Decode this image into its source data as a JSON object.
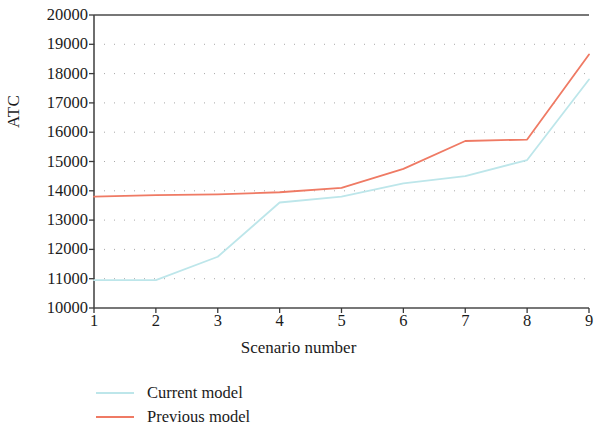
{
  "chart_data": {
    "type": "line",
    "title": "",
    "xlabel": "Scenario number",
    "ylabel": "ATC",
    "x": [
      1,
      2,
      3,
      4,
      5,
      6,
      7,
      8,
      9
    ],
    "xtick_labels": [
      "1",
      "2",
      "3",
      "4",
      "5",
      "6",
      "7",
      "8",
      "9"
    ],
    "ytick_labels": [
      "20000",
      "19000",
      "18000",
      "17000",
      "16000",
      "15000",
      "14000",
      "13000",
      "12000",
      "11000",
      "10000"
    ],
    "ytick_values": [
      20000,
      19000,
      18000,
      17000,
      16000,
      15000,
      14000,
      13000,
      12000,
      11000,
      10000
    ],
    "xlim": [
      1,
      9
    ],
    "ylim": [
      10000,
      20000
    ],
    "grid": "dotted-horizontal",
    "legend_position": "below-left",
    "series": [
      {
        "name": "Current model",
        "color": "#bde6ea",
        "values": [
          10950,
          10950,
          11750,
          13600,
          13800,
          14250,
          14500,
          15050,
          17800
        ]
      },
      {
        "name": "Previous model",
        "color": "#ef7a64",
        "values": [
          13800,
          13850,
          13880,
          13950,
          14100,
          14750,
          15700,
          15750,
          18650
        ]
      }
    ]
  },
  "axes": {
    "y_axis_label": "ATC",
    "x_axis_label": "Scenario number"
  },
  "legend": {
    "entries": [
      {
        "label": "Current model",
        "color": "#bde6ea"
      },
      {
        "label": "Previous model",
        "color": "#ef7a64"
      }
    ]
  }
}
